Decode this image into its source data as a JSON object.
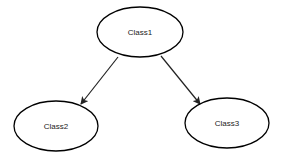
{
  "diagram": {
    "type": "class-hierarchy",
    "background": "#ffffff",
    "nodes": [
      {
        "id": "class1",
        "label": "Class1",
        "shape": "ellipse",
        "cx": 140,
        "cy": 32,
        "rx": 43,
        "ry": 25
      },
      {
        "id": "class2",
        "label": "Class2",
        "shape": "ellipse",
        "cx": 56,
        "cy": 126,
        "rx": 42,
        "ry": 25
      },
      {
        "id": "class3",
        "label": "Class3",
        "shape": "ellipse",
        "cx": 227,
        "cy": 123,
        "rx": 42,
        "ry": 25
      }
    ],
    "edges": [
      {
        "from": "class1",
        "to": "class2",
        "x1": 118,
        "y1": 57,
        "x2": 81,
        "y2": 104,
        "arrow": "filled-triangle"
      },
      {
        "from": "class1",
        "to": "class3",
        "x1": 161,
        "y1": 56,
        "x2": 200,
        "y2": 104,
        "arrow": "filled-triangle"
      }
    ]
  }
}
